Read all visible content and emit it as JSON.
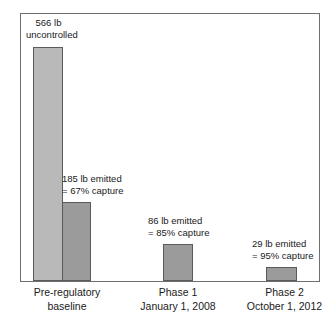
{
  "chart_data": {
    "type": "bar",
    "title": "",
    "xlabel": "",
    "ylabel": "",
    "grid": false,
    "legend": "none",
    "ylim": [
      0,
      566
    ],
    "units": "lb",
    "categories": [
      "Pre-regulatory baseline",
      "Phase 1 January 1, 2008",
      "Phase 2 October 1, 2012"
    ],
    "series": [
      {
        "name": "Uncontrolled emissions",
        "color": "#b9b9b9",
        "values": [
          566,
          null,
          null
        ]
      },
      {
        "name": "Emitted",
        "color": "#9b9b9b",
        "values": [
          185,
          86,
          29
        ]
      }
    ],
    "capture_percent": [
      67,
      85,
      95
    ],
    "annotations": [
      {
        "target": "baseline-uncontrolled",
        "line1": "566 lb",
        "line2": "uncontrolled"
      },
      {
        "target": "baseline-emitted",
        "line1": "185 lb emitted",
        "line2": "= 67% capture"
      },
      {
        "target": "phase1-emitted",
        "line1": "86 lb emitted",
        "line2": "= 85% capture"
      },
      {
        "target": "phase2-emitted",
        "line1": "29 lb emitted",
        "line2": "= 95% capture"
      }
    ]
  },
  "axis": {
    "categories": [
      {
        "line1": "Pre-regulatory",
        "line2": "baseline"
      },
      {
        "line1": "Phase 1",
        "line2": "January 1, 2008"
      },
      {
        "line1": "Phase 2",
        "line2": "October 1, 2012"
      }
    ]
  },
  "colors": {
    "bar_light": "#b9b9b9",
    "bar_dark": "#9b9b9b",
    "bar_border": "#5a5a5a",
    "frame": "#6f6f6f",
    "text": "#1a1a1a",
    "background": "#ffffff"
  }
}
